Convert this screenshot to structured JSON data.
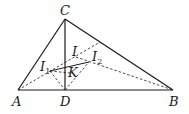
{
  "diagram": {
    "type": "geometry",
    "points": {
      "A": {
        "label": "A",
        "x": 18,
        "y": 90
      },
      "B": {
        "label": "B",
        "x": 173,
        "y": 90
      },
      "C": {
        "label": "C",
        "x": 65,
        "y": 19
      },
      "D": {
        "label": "D",
        "x": 65,
        "y": 90
      },
      "I": {
        "label": "I",
        "x": 76,
        "y": 57
      },
      "I1": {
        "label": "I",
        "sub": "1",
        "x": 50,
        "y": 71
      },
      "I2": {
        "label": "I",
        "sub": "2",
        "x": 89,
        "y": 62
      },
      "K": {
        "label": "K",
        "x": 72,
        "y": 73
      }
    },
    "solid_segments": [
      [
        "A",
        "C"
      ],
      [
        "C",
        "B"
      ],
      [
        "A",
        "B"
      ],
      [
        "C",
        "D"
      ],
      [
        "I1",
        "I2"
      ]
    ],
    "dashed_segments": [
      [
        "A",
        "E"
      ],
      [
        "I",
        "B"
      ],
      [
        "I1",
        "D"
      ],
      [
        "D",
        "I2"
      ],
      [
        "I1",
        "K"
      ]
    ],
    "extra_points": {
      "E": {
        "x": 100,
        "y": 42
      }
    }
  }
}
